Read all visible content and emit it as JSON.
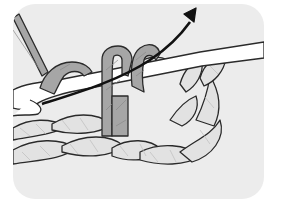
{
  "illustration": {
    "subject": "crochet stitch diagram",
    "elements": [
      "crochet-hook",
      "yarn-loops-on-hook",
      "foundation-chain",
      "direction-arrow"
    ],
    "colors": {
      "card_background": "#ececec",
      "page_background": "#ffffff",
      "working_yarn": "#a6a6a6",
      "chain_yarn": "#e2e2e2",
      "hook": "#ffffff",
      "outline": "#2a2a2a",
      "arrow": "#111111"
    }
  }
}
